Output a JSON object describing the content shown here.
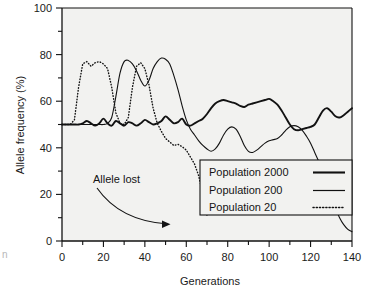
{
  "chart_data": {
    "type": "line",
    "title": "",
    "xlabel": "Generations",
    "ylabel": "Allele frequency (%)",
    "xlim": [
      0,
      140
    ],
    "ylim": [
      0,
      100
    ],
    "xticks": [
      0,
      20,
      40,
      60,
      80,
      100,
      120,
      140
    ],
    "xtick_labels": [
      "0",
      "20",
      "40",
      "60",
      "80",
      "100",
      "120",
      "140"
    ],
    "xminor_step": 10,
    "yticks": [
      0,
      20,
      40,
      60,
      80,
      100
    ],
    "ytick_labels": [
      "0",
      "20",
      "40",
      "60",
      "80",
      "100"
    ],
    "yminor_step": 10,
    "grid": false,
    "legend_position": "lower right",
    "plot_background": "#f2f2f0",
    "line_color": "#121212",
    "series": [
      {
        "name": "Population 2000",
        "style": "solid",
        "width": 1.9,
        "x": [
          0,
          2,
          4,
          6,
          8,
          10,
          12,
          14,
          16,
          18,
          20,
          22,
          24,
          26,
          28,
          30,
          32,
          34,
          36,
          38,
          40,
          42,
          44,
          46,
          48,
          50,
          52,
          54,
          56,
          58,
          60,
          62,
          64,
          66,
          68,
          70,
          72,
          74,
          76,
          78,
          80,
          82,
          84,
          86,
          88,
          90,
          92,
          94,
          96,
          98,
          100,
          102,
          104,
          106,
          108,
          110,
          112,
          114,
          116,
          118,
          120,
          122,
          124,
          126,
          128,
          130,
          132,
          134,
          136,
          138,
          140
        ],
        "values": [
          50,
          50,
          50,
          50,
          50,
          50.5,
          51.5,
          50.5,
          49.5,
          50.5,
          52.5,
          50.5,
          49.5,
          51.5,
          50.5,
          49.5,
          51,
          50.5,
          49.5,
          50.5,
          52,
          51,
          50,
          50.5,
          51.5,
          53.5,
          52,
          50.5,
          51,
          52.5,
          50,
          49.5,
          50.5,
          51.5,
          52.5,
          54.5,
          57,
          59,
          60,
          60.5,
          60,
          59.5,
          59,
          58,
          57.5,
          58.5,
          59,
          59.5,
          60,
          60.5,
          61,
          60,
          58.5,
          56,
          53,
          50,
          48,
          47.5,
          48,
          48.5,
          49,
          50,
          53,
          56,
          57,
          55.5,
          53.5,
          53,
          54,
          55.5,
          57
        ]
      },
      {
        "name": "Population 200",
        "style": "solid",
        "width": 1.1,
        "x": [
          0,
          2,
          4,
          6,
          8,
          10,
          12,
          14,
          16,
          18,
          20,
          22,
          24,
          26,
          28,
          30,
          32,
          34,
          36,
          38,
          40,
          42,
          44,
          46,
          48,
          50,
          52,
          54,
          56,
          58,
          60,
          62,
          64,
          66,
          68,
          70,
          72,
          74,
          76,
          78,
          80,
          82,
          84,
          86,
          88,
          90,
          92,
          94,
          96,
          98,
          100,
          102,
          104,
          106,
          108,
          110,
          112,
          114,
          116,
          118,
          120,
          122,
          124,
          126,
          128,
          130,
          132,
          134,
          136,
          138,
          140
        ],
        "values": [
          50,
          50,
          50,
          50,
          50,
          50,
          50,
          50,
          50,
          50,
          50,
          50.5,
          53,
          62,
          72,
          77,
          77.5,
          76,
          73,
          69,
          66.5,
          69,
          74,
          77,
          78.5,
          78,
          76,
          71,
          65,
          58,
          52,
          48,
          45.5,
          43,
          41,
          39.5,
          38.5,
          39.5,
          42,
          45.5,
          48,
          49,
          48,
          45,
          41,
          38.5,
          38,
          39,
          40.5,
          42,
          43,
          43.5,
          44,
          45.5,
          47.5,
          49,
          49.5,
          49,
          47.5,
          45,
          42,
          38,
          34,
          29,
          24,
          19,
          14,
          10,
          7,
          5,
          4
        ]
      },
      {
        "name": "Population 20",
        "style": "dotted",
        "width": 1.4,
        "x": [
          0,
          2,
          4,
          6,
          8,
          10,
          12,
          14,
          16,
          18,
          20,
          22,
          24,
          26,
          28,
          30,
          32,
          34,
          36,
          38,
          40,
          42,
          44,
          46,
          48,
          50,
          52,
          54,
          56,
          58,
          60,
          62,
          64,
          66,
          68,
          70
        ],
        "values": [
          50,
          50,
          50,
          52,
          66,
          76,
          77,
          75,
          76.5,
          77,
          76,
          74,
          66,
          55,
          50.5,
          50,
          53,
          66,
          75,
          76.5,
          74,
          67,
          57,
          50.5,
          47,
          44,
          42.5,
          41,
          41.5,
          40.5,
          39,
          36,
          33,
          28,
          20,
          11
        ]
      }
    ],
    "annotations": [
      {
        "text": "Allele lost",
        "x": 34,
        "y": 17
      }
    ]
  },
  "legend": {
    "entries": [
      {
        "label": "Population 2000",
        "style": "solid-thick"
      },
      {
        "label": "Population 200",
        "style": "solid-thin"
      },
      {
        "label": "Population 20",
        "style": "dotted"
      }
    ]
  },
  "artifacts": {
    "left_edge_text": "n"
  }
}
